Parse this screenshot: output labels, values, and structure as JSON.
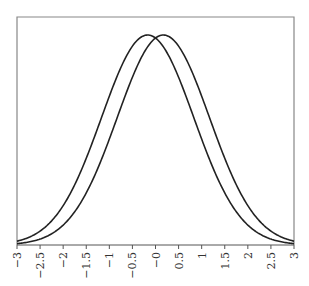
{
  "chart_data": {
    "type": "line",
    "title": "",
    "xlabel": "",
    "ylabel": "",
    "xlim": [
      -3,
      3
    ],
    "ylim": [
      0,
      0.4
    ],
    "grid": false,
    "legend": null,
    "x_ticks": [
      -3,
      -2.5,
      -2,
      -1.5,
      -1,
      -0.5,
      0,
      0.5,
      1,
      1.5,
      2,
      2.5,
      3
    ],
    "x_tick_labels": [
      "−3",
      "−2.5",
      "−2",
      "−1.5",
      "−1",
      "−0.5",
      "−0",
      "0.5",
      "1",
      "1.5",
      "2",
      "2.5",
      "3"
    ],
    "series": [
      {
        "name": "curve-left",
        "kind": "normal-density",
        "mean": -0.17,
        "sd": 1.0,
        "color": "#222222"
      },
      {
        "name": "curve-right",
        "kind": "normal-density",
        "mean": 0.17,
        "sd": 1.0,
        "color": "#222222"
      }
    ]
  },
  "layout": {
    "plot_left": 17,
    "plot_right": 294,
    "plot_top": 17,
    "plot_bottom": 245,
    "peak_y": 35
  }
}
